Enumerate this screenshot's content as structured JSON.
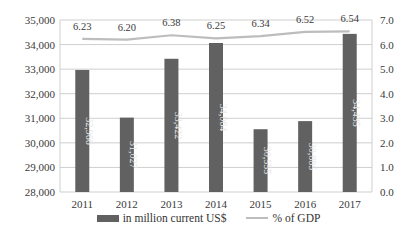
{
  "chart_data": {
    "type": "bar+line",
    "title": "",
    "categories": [
      "2011",
      "2012",
      "2013",
      "2014",
      "2015",
      "2016",
      "2017"
    ],
    "series": [
      {
        "name": "in million current US$",
        "type": "bar",
        "axis": "left",
        "color": "#616161",
        "values": [
          32966,
          31027,
          33422,
          34064,
          30555,
          30885,
          34435
        ],
        "labels": [
          "32,966",
          "31,027",
          "33,422",
          "34,064",
          "30,555",
          "30,885",
          "34,435"
        ]
      },
      {
        "name": "% of GDP",
        "type": "line",
        "axis": "right",
        "color": "#bdbdbd",
        "values": [
          6.23,
          6.2,
          6.38,
          6.25,
          6.34,
          6.52,
          6.54
        ],
        "labels": [
          "6.23",
          "6.20",
          "6.38",
          "6.25",
          "6.34",
          "6.52",
          "6.54"
        ]
      }
    ],
    "left_axis": {
      "range": [
        28000,
        35000
      ],
      "ticks": [
        "28,000",
        "29,000",
        "30,000",
        "31,000",
        "32,000",
        "33,000",
        "34,000",
        "35,000"
      ]
    },
    "right_axis": {
      "range": [
        0.0,
        7.0
      ],
      "ticks": [
        "0.0",
        "1.0",
        "2.0",
        "3.0",
        "4.0",
        "5.0",
        "6.0",
        "7.0"
      ]
    },
    "xlabel": "",
    "ylabel": "",
    "grid": true,
    "legend_position": "bottom"
  },
  "legend": {
    "bar_label": "in million current US$",
    "line_label": "% of GDP"
  },
  "colors": {
    "bar": "#616161",
    "line": "#bdbdbd",
    "grid": "#cfcfcf",
    "axis_text": "#3a3a3a"
  }
}
